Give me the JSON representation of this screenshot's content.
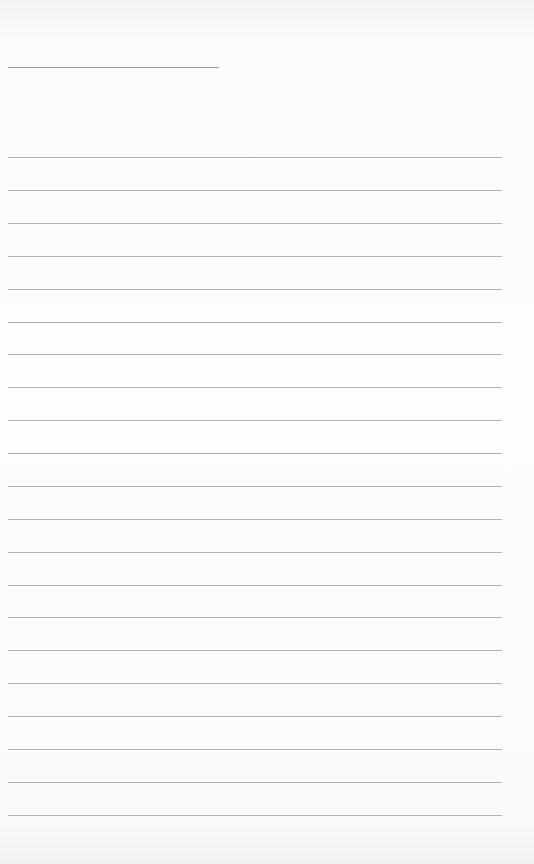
{
  "page": {
    "type": "lined-paper",
    "background_color": "#f6f6f5",
    "line_color": "#b3b3b3",
    "header_line": {
      "y": 67,
      "x": 8,
      "width": 211
    },
    "ruled_lines": {
      "count": 21,
      "x": 8,
      "width": 494,
      "positions_y": [
        157,
        190,
        223,
        256,
        289,
        322,
        354,
        387,
        420,
        453,
        486,
        519,
        552,
        585,
        617,
        650,
        683,
        716,
        749,
        782,
        815
      ]
    }
  }
}
